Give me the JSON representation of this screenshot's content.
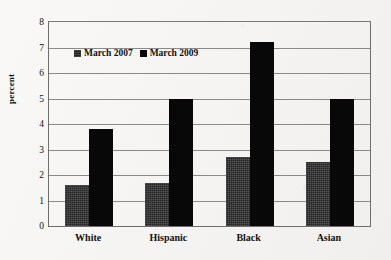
{
  "chart_data": {
    "type": "bar",
    "title": "",
    "xlabel": "",
    "ylabel": "percent",
    "ylim": [
      0,
      8
    ],
    "ytick_step": 1,
    "yticks": [
      "8",
      "7",
      "6",
      "5",
      "4",
      "3",
      "2",
      "1",
      "0"
    ],
    "grid": true,
    "legend_position": "upper-left-inside",
    "categories": [
      "White",
      "Hispanic",
      "Black",
      "Asian"
    ],
    "series": [
      {
        "name": "March 2007",
        "color": "#262626",
        "values": [
          1.6,
          1.7,
          2.7,
          2.5
        ]
      },
      {
        "name": "March 2009",
        "color": "#080808",
        "values": [
          3.8,
          5.0,
          7.2,
          5.0
        ]
      }
    ]
  },
  "legend": {
    "items": [
      {
        "label": "March 2007",
        "swatch": "legend-swatch-march-2007"
      },
      {
        "label": "March 2009",
        "swatch": "legend-swatch-march-2009"
      }
    ]
  },
  "axes": {
    "y_axis_title": "percent"
  }
}
